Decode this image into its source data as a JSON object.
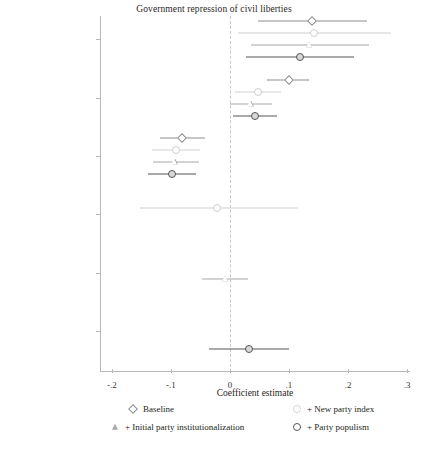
{
  "chart_data": {
    "type": "scatter",
    "title": "Government repression of civil liberties",
    "xlabel": "Coefficient estimate",
    "ylabel": "",
    "xlim": [
      -0.22,
      0.305
    ],
    "xticks": [
      -0.2,
      -0.1,
      0,
      0.1,
      0.2,
      0.3
    ],
    "xticklabels": [
      "-.2",
      "-.1",
      "0",
      ".1",
      ".2",
      ".3"
    ],
    "grid": false,
    "zero_reference_line": 0,
    "legend_position": "bottom",
    "categories": [
      "Party personalism",
      "Democracy age",
      "Initial democracy level",
      "New parties index",
      "Initial party institutionalization",
      "Party populism"
    ],
    "series": [
      {
        "name": "Baseline",
        "marker": "diamond",
        "color": "#8d8d8d",
        "points": [
          {
            "category": "Party personalism",
            "estimate": 0.139,
            "ci_low": 0.048,
            "ci_high": 0.232
          },
          {
            "category": "Democracy age",
            "estimate": 0.1,
            "ci_low": 0.063,
            "ci_high": 0.134
          },
          {
            "category": "Initial democracy level",
            "estimate": -0.081,
            "ci_low": -0.119,
            "ci_high": -0.042
          },
          {
            "category": "New parties index",
            "estimate": null,
            "ci_low": null,
            "ci_high": null
          },
          {
            "category": "Initial party institutionalization",
            "estimate": null,
            "ci_low": null,
            "ci_high": null
          },
          {
            "category": "Party populism",
            "estimate": null,
            "ci_low": null,
            "ci_high": null
          }
        ]
      },
      {
        "name": "+ New party index",
        "marker": "circle-light",
        "color": "#cfcfcf",
        "points": [
          {
            "category": "Party personalism",
            "estimate": 0.142,
            "ci_low": 0.013,
            "ci_high": 0.272
          },
          {
            "category": "Democracy age",
            "estimate": 0.047,
            "ci_low": 0.008,
            "ci_high": 0.086
          },
          {
            "category": "Initial democracy level",
            "estimate": -0.092,
            "ci_low": -0.132,
            "ci_high": -0.05
          },
          {
            "category": "New parties index",
            "estimate": -0.022,
            "ci_low": -0.153,
            "ci_high": 0.115
          },
          {
            "category": "Initial party institutionalization",
            "estimate": null,
            "ci_low": null,
            "ci_high": null
          },
          {
            "category": "Party populism",
            "estimate": null,
            "ci_low": null,
            "ci_high": null
          }
        ]
      },
      {
        "name": "+ Initial party institutionalization",
        "marker": "triangle",
        "color": "#a8a8a8",
        "points": [
          {
            "category": "Party personalism",
            "estimate": 0.134,
            "ci_low": 0.035,
            "ci_high": 0.235
          },
          {
            "category": "Democracy age",
            "estimate": 0.035,
            "ci_low": 0.0,
            "ci_high": 0.071
          },
          {
            "category": "Initial democracy level",
            "estimate": -0.093,
            "ci_low": -0.131,
            "ci_high": -0.053
          },
          {
            "category": "New parties index",
            "estimate": null,
            "ci_low": null,
            "ci_high": null
          },
          {
            "category": "Initial party institutionalization",
            "estimate": -0.008,
            "ci_low": -0.047,
            "ci_high": 0.031
          },
          {
            "category": "Party populism",
            "estimate": null,
            "ci_low": null,
            "ci_high": null
          }
        ]
      },
      {
        "name": "+ Party populism",
        "marker": "circle-dark",
        "color": "#555555",
        "points": [
          {
            "category": "Party personalism",
            "estimate": 0.119,
            "ci_low": 0.027,
            "ci_high": 0.21
          },
          {
            "category": "Democracy age",
            "estimate": 0.042,
            "ci_low": 0.006,
            "ci_high": 0.079
          },
          {
            "category": "Initial democracy level",
            "estimate": -0.098,
            "ci_low": -0.138,
            "ci_high": -0.058
          },
          {
            "category": "New parties index",
            "estimate": null,
            "ci_low": null,
            "ci_high": null
          },
          {
            "category": "Initial party institutionalization",
            "estimate": null,
            "ci_low": null,
            "ci_high": null
          },
          {
            "category": "Party populism",
            "estimate": 0.033,
            "ci_low": -0.035,
            "ci_high": 0.1
          }
        ]
      }
    ]
  },
  "legend": {
    "items": [
      {
        "label": "Baseline",
        "marker": "diamond"
      },
      {
        "label": "+ New party index",
        "marker": "circle-light"
      },
      {
        "label": "+ Initial party institutionalization",
        "marker": "triangle"
      },
      {
        "label": "+ Party populism",
        "marker": "circle-dark"
      }
    ]
  }
}
